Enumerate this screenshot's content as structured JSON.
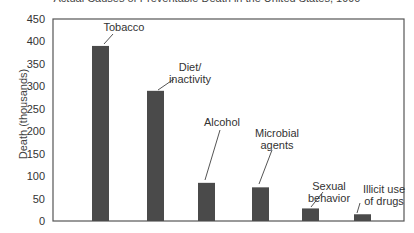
{
  "chart_data": {
    "type": "bar",
    "title": "Actual Causes of Preventable Death in the United States, 1990",
    "xlabel": "",
    "ylabel": "Death (thousands)",
    "ylim": [
      0,
      450
    ],
    "yticks": [
      0,
      50,
      100,
      150,
      200,
      250,
      300,
      350,
      400,
      450
    ],
    "grid": false,
    "legend": null,
    "categories": [
      "Tobacco",
      "Diet/ inactivity",
      "Alcohol",
      "Microbial agents",
      "Sexual behavior",
      "Illicit use of drugs"
    ],
    "values": [
      390,
      290,
      85,
      75,
      28,
      15
    ],
    "annotations": [
      {
        "lines": [
          "Tobacco"
        ]
      },
      {
        "lines": [
          "Diet/",
          "inactivity"
        ]
      },
      {
        "lines": [
          "Alcohol"
        ]
      },
      {
        "lines": [
          "Microbial",
          "agents"
        ]
      },
      {
        "lines": [
          "Sexual",
          "behavior"
        ]
      },
      {
        "lines": [
          "Illicit use",
          "of drugs"
        ]
      }
    ],
    "colors": {
      "bar": "#4a4a4a",
      "axis": "#555555",
      "text": "#333333"
    }
  }
}
